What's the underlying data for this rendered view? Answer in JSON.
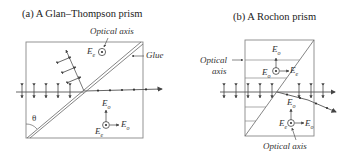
{
  "panel_a": {
    "title": "(a) A Glan–Thompson prism",
    "optical_axis_label": "Optical axis",
    "glue_label": "Glue",
    "theta_label": "θ",
    "ee_label": "E",
    "ee_sub": "e",
    "eo_label": "E",
    "eo_sub": "o",
    "eo2_label": "E",
    "eo2_sub": "o",
    "ee2_label": "E",
    "ee2_sub": "e"
  },
  "panel_b": {
    "title": "(b) A Rochon prism",
    "optical_axis_left_line1": "Optical",
    "optical_axis_left_line2": "axis",
    "optical_axis_bottom": "Optical axis",
    "top_eo_label": "E",
    "top_eo_sub": "o",
    "top_eo2_label": "E",
    "top_eo2_sub": "o",
    "top_ee_label": "E",
    "top_ee_sub": "e",
    "bottom_eo_label": "E",
    "bottom_eo_sub": "o",
    "bottom_ee_label": "E",
    "bottom_ee_sub": "e",
    "bottom_eo2_label": "E",
    "bottom_eo2_sub": "o"
  },
  "colors": {
    "line": "#555555",
    "text": "#333333",
    "box": "#888888"
  }
}
